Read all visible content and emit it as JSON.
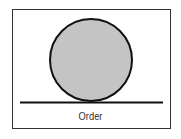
{
  "diagram": {
    "label": "Order",
    "shapes": {
      "circle": {
        "fill": "#c4c4c4",
        "stroke": "#111111"
      },
      "baseline": {
        "stroke": "#111111"
      }
    },
    "colors": {
      "frame": "#333333",
      "background": "#ffffff"
    }
  }
}
